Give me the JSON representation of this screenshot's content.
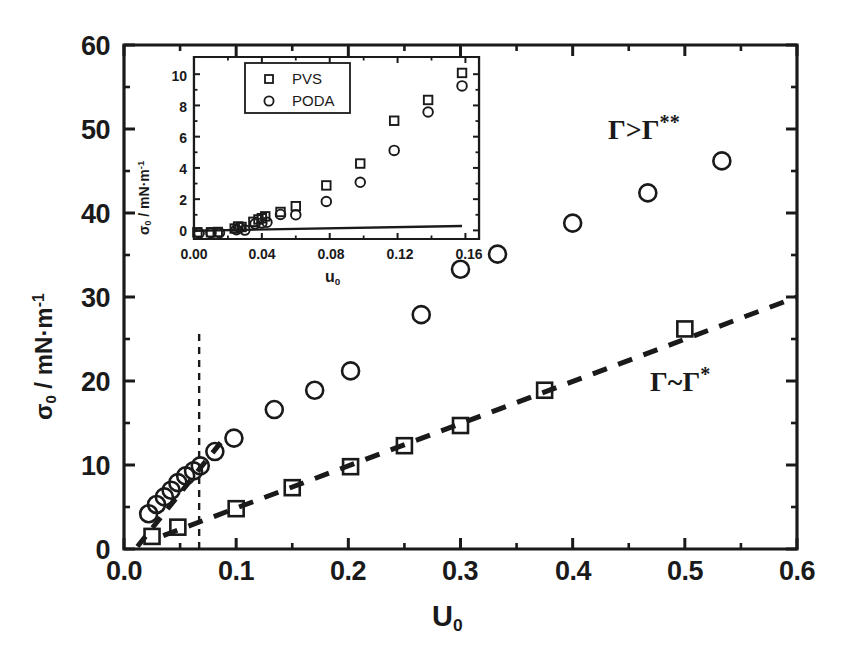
{
  "figure": {
    "background": "#ffffff",
    "ink": "#1a1a1a"
  },
  "chart_data": {
    "type": "scatter",
    "title": "",
    "xlabel": "U0",
    "xlabel_html": "U<sub>0</sub>",
    "ylabel": "sigma0 / mN·m^-1",
    "xlim": [
      0.0,
      0.6
    ],
    "ylim": [
      0,
      60
    ],
    "xticks": [
      "0.0",
      "0.1",
      "0.2",
      "0.3",
      "0.4",
      "0.5",
      "0.6"
    ],
    "xtick_values": [
      0.0,
      0.1,
      0.2,
      0.3,
      0.4,
      0.5,
      0.6
    ],
    "yticks": [
      "0",
      "10",
      "20",
      "30",
      "40",
      "50",
      "60"
    ],
    "ytick_values": [
      0,
      10,
      20,
      30,
      40,
      50,
      60
    ],
    "minor_ticks": true,
    "grid": false,
    "legend": "none",
    "series": [
      {
        "name": "PODA",
        "marker": "circle",
        "points": [
          [
            0.022,
            4.2
          ],
          [
            0.029,
            5.3
          ],
          [
            0.036,
            6.2
          ],
          [
            0.042,
            7.0
          ],
          [
            0.048,
            7.9
          ],
          [
            0.055,
            8.7
          ],
          [
            0.062,
            9.3
          ],
          [
            0.068,
            9.9
          ],
          [
            0.081,
            11.6
          ],
          [
            0.098,
            13.2
          ],
          [
            0.134,
            16.6
          ],
          [
            0.17,
            18.9
          ],
          [
            0.202,
            21.2
          ],
          [
            0.265,
            27.9
          ],
          [
            0.3,
            33.3
          ],
          [
            0.333,
            35.1
          ],
          [
            0.4,
            38.8
          ],
          [
            0.467,
            42.4
          ],
          [
            0.533,
            46.2
          ]
        ]
      },
      {
        "name": "PVS",
        "marker": "square",
        "points": [
          [
            0.025,
            1.5
          ],
          [
            0.048,
            2.6
          ],
          [
            0.1,
            4.8
          ],
          [
            0.15,
            7.3
          ],
          [
            0.202,
            9.8
          ],
          [
            0.25,
            12.3
          ],
          [
            0.3,
            14.7
          ],
          [
            0.375,
            18.9
          ],
          [
            0.5,
            26.2
          ]
        ]
      }
    ],
    "fits": [
      {
        "name": "steep-dashed-fit",
        "style": "dashed",
        "x": [
          0.012,
          0.09
        ],
        "y": [
          0.3,
          13.3
        ]
      },
      {
        "name": "shallow-dashed-fit",
        "style": "dashed",
        "x": [
          0.035,
          0.6
        ],
        "y": [
          1.6,
          30.0
        ]
      }
    ],
    "vertical_marker": {
      "name": "threshold-line",
      "style": "dashed",
      "x": 0.067,
      "y_from": 0,
      "y_to": 26.0
    },
    "annotations": [
      {
        "name": "gamma-gt-gamma-dstar",
        "text": "Γ>Γ**",
        "x": 0.44,
        "y": 49.0
      },
      {
        "name": "gamma-sim-gamma-star",
        "text": "Γ~Γ*",
        "x": 0.475,
        "y": 21.6
      }
    ],
    "inset": {
      "type": "scatter",
      "xlabel": "u0",
      "xlabel_html": "u<sub>0</sub>",
      "ylabel": "sigma0 / mN·m^-1",
      "xlim": [
        0.0,
        0.168
      ],
      "ylim": [
        -0.55,
        11.1
      ],
      "xticks": [
        "0.00",
        "0.04",
        "0.08",
        "0.12",
        "0.16"
      ],
      "xtick_values": [
        0.0,
        0.04,
        0.08,
        0.12,
        0.16
      ],
      "yticks": [
        "0",
        "2",
        "4",
        "6",
        "8",
        "10"
      ],
      "ytick_values": [
        0,
        2,
        4,
        6,
        8,
        10
      ],
      "grid": false,
      "legend": {
        "position": "top-center",
        "entries": [
          "PVS",
          "PODA"
        ]
      },
      "series": [
        {
          "name": "PVS",
          "marker": "square",
          "points": [
            [
              0.002,
              -0.12
            ],
            [
              0.01,
              -0.12
            ],
            [
              0.014,
              -0.1
            ],
            [
              0.024,
              0.12
            ],
            [
              0.026,
              0.25
            ],
            [
              0.028,
              0.22
            ],
            [
              0.035,
              0.55
            ],
            [
              0.038,
              0.7
            ],
            [
              0.04,
              0.78
            ],
            [
              0.042,
              0.9
            ],
            [
              0.051,
              1.18
            ],
            [
              0.06,
              1.55
            ],
            [
              0.078,
              2.88
            ],
            [
              0.098,
              4.28
            ],
            [
              0.118,
              7.02
            ],
            [
              0.138,
              8.35
            ],
            [
              0.158,
              10.08
            ]
          ]
        },
        {
          "name": "PODA",
          "marker": "circle",
          "points": [
            [
              0.003,
              -0.18
            ],
            [
              0.01,
              -0.15
            ],
            [
              0.015,
              -0.15
            ],
            [
              0.025,
              0.05
            ],
            [
              0.027,
              0.18
            ],
            [
              0.03,
              0.02
            ],
            [
              0.036,
              0.42
            ],
            [
              0.04,
              0.48
            ],
            [
              0.043,
              0.52
            ],
            [
              0.051,
              1.02
            ],
            [
              0.06,
              1.0
            ],
            [
              0.078,
              1.85
            ],
            [
              0.098,
              3.08
            ],
            [
              0.118,
              5.12
            ],
            [
              0.138,
              7.58
            ],
            [
              0.158,
              9.25
            ]
          ]
        }
      ],
      "fit_line": {
        "name": "solid-baseline-fit",
        "style": "solid",
        "x": [
          0.0,
          0.158
        ],
        "y": [
          -0.02,
          0.28
        ]
      }
    }
  }
}
